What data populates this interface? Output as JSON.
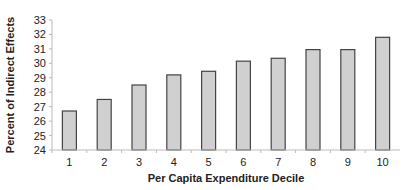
{
  "chart_data": {
    "type": "bar",
    "title": "",
    "xlabel": "Per Capita Expenditure Decile",
    "ylabel": "Percent of Indirect Effects",
    "categories": [
      "1",
      "2",
      "3",
      "4",
      "5",
      "6",
      "7",
      "8",
      "9",
      "10"
    ],
    "values": [
      26.7,
      27.5,
      28.5,
      29.2,
      29.45,
      30.15,
      30.35,
      30.95,
      30.95,
      31.8
    ],
    "ylim": [
      24,
      33
    ],
    "yticks": [
      24,
      25,
      26,
      27,
      28,
      29,
      30,
      31,
      32,
      33
    ],
    "grid": false,
    "legend": null,
    "bar_color": "#d0d0d0",
    "bar_edge_color": "#444444"
  }
}
